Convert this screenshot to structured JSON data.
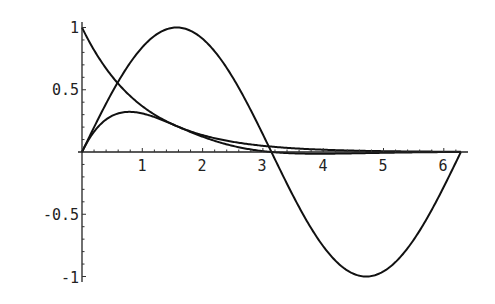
{
  "chart_data": {
    "type": "line",
    "title": "",
    "xlabel": "",
    "ylabel": "",
    "xlim": [
      0,
      6.283
    ],
    "ylim": [
      -1,
      1
    ],
    "grid": false,
    "legend": null,
    "x_ticks": [
      1,
      2,
      3,
      4,
      5,
      6
    ],
    "x_tick_labels": [
      "1",
      "2",
      "3",
      "4",
      "5",
      "6"
    ],
    "y_ticks": [
      1,
      0.5,
      -0.5,
      -1
    ],
    "y_tick_labels": [
      "1",
      "0.5",
      "-0.5",
      "-1"
    ],
    "series": [
      {
        "name": "sin(x)",
        "x": [
          0,
          0.5,
          1,
          1.5708,
          2,
          2.5,
          3,
          3.1416,
          3.5,
          4,
          4.5,
          4.7124,
          5,
          5.5,
          6,
          6.2832
        ],
        "values": [
          0,
          0.479,
          0.841,
          1.0,
          0.909,
          0.598,
          0.141,
          0,
          -0.351,
          -0.757,
          -0.978,
          -1.0,
          -0.959,
          -0.706,
          -0.279,
          0
        ]
      },
      {
        "name": "exp(-x)",
        "x": [
          0,
          0.5,
          1,
          1.5,
          2,
          2.5,
          3,
          3.5,
          4,
          4.5,
          5,
          5.5,
          6,
          6.2832
        ],
        "values": [
          1.0,
          0.607,
          0.368,
          0.223,
          0.135,
          0.082,
          0.05,
          0.03,
          0.018,
          0.011,
          0.007,
          0.004,
          0.002,
          0.002
        ]
      },
      {
        "name": "exp(-x)*sin(x)",
        "x": [
          0,
          0.25,
          0.5,
          0.7854,
          1,
          1.5,
          2,
          2.5,
          3,
          3.1416,
          3.5,
          4,
          4.5,
          5,
          5.5,
          6,
          6.2832
        ],
        "values": [
          0,
          0.193,
          0.291,
          0.322,
          0.31,
          0.223,
          0.123,
          0.049,
          0.007,
          0,
          -0.011,
          -0.014,
          -0.011,
          -0.006,
          -0.003,
          -0.001,
          0
        ]
      }
    ]
  },
  "axes": {
    "x_tick_labels": [
      "1",
      "2",
      "3",
      "4",
      "5",
      "6"
    ],
    "y_tick_labels": [
      "1",
      "0.5",
      "-0.5",
      "-1"
    ]
  }
}
